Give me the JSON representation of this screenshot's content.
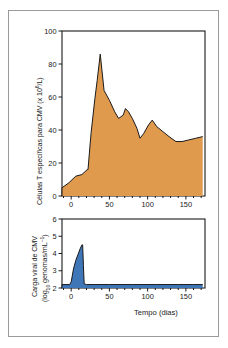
{
  "figure": {
    "background_color": "#ffffff",
    "frame_color": "#9a9a9a",
    "axis_color": "#1a1a1a"
  },
  "chart_data": [
    {
      "type": "area",
      "panel": "top",
      "title": "",
      "xlabel": "",
      "ylabel": "Células T específicas para CMV (x 10⁶/L)",
      "ylabel_main": "Células T específicas para CMV (x 10",
      "ylabel_exp": "6",
      "ylabel_tail": "/L)",
      "series_name": "Células T específicas para CMV",
      "fill_color": "#E09A4E",
      "line_color": "#1a1a1a",
      "xlim": [
        -12,
        175
      ],
      "ylim": [
        0,
        100
      ],
      "xticks": [
        0,
        50,
        100,
        150
      ],
      "yticks": [
        0,
        20,
        40,
        60,
        80,
        100
      ],
      "ytick_labels": [
        "0",
        "20",
        "40",
        "60",
        "80",
        "100"
      ],
      "xtick_labels": [
        "0",
        "50",
        "100",
        "150"
      ],
      "grid": false,
      "legend": "none",
      "x": [
        -12,
        -3,
        6,
        14,
        21,
        22,
        26,
        31,
        34,
        38,
        43,
        50,
        57,
        62,
        68,
        71,
        75,
        80,
        86,
        90,
        95,
        101,
        106,
        112,
        120,
        128,
        137,
        145,
        154,
        163,
        172
      ],
      "y": [
        5,
        8,
        12,
        13,
        16,
        16,
        38,
        59,
        70,
        86,
        64,
        58,
        51,
        47,
        49,
        53,
        51,
        47,
        41,
        35,
        38,
        43,
        46,
        42,
        39,
        36,
        33,
        33,
        34,
        35,
        36
      ]
    },
    {
      "type": "area",
      "panel": "bottom",
      "title": "",
      "xlabel": "Tempo (dias)",
      "ylabel": "Carga viral de CMV (log₁₀ genomas/mL⁻¹)",
      "ylabel_line1": "Carga viral de CMV",
      "ylabel_line2_main": "(log",
      "ylabel_line2_sub": "10",
      "ylabel_line2_tail": " genomas/mL",
      "ylabel_line2_exp": "−1",
      "ylabel_line2_close": ")",
      "series_name": "Carga viral de CMV",
      "fill_color": "#3E76B8",
      "line_color": "#1a1a1a",
      "xlim": [
        -12,
        175
      ],
      "ylim": [
        2,
        6
      ],
      "xticks": [
        0,
        50,
        100,
        150
      ],
      "yticks": [
        2,
        3,
        4,
        5,
        6
      ],
      "ytick_labels": [
        "2",
        "3",
        "4",
        "5",
        "6"
      ],
      "xtick_labels": [
        "0",
        "50",
        "100",
        "150"
      ],
      "grid": false,
      "legend": "none",
      "baseline": 2.2,
      "x": [
        -12,
        -2,
        0,
        3,
        6,
        9,
        12,
        14,
        15,
        16,
        17,
        20,
        30,
        50,
        80,
        110,
        140,
        160,
        172
      ],
      "y": [
        2.2,
        2.2,
        2.35,
        3.1,
        3.6,
        3.95,
        4.3,
        4.5,
        4.5,
        3.3,
        2.25,
        2.2,
        2.2,
        2.2,
        2.2,
        2.2,
        2.2,
        2.2,
        2.2
      ]
    }
  ]
}
